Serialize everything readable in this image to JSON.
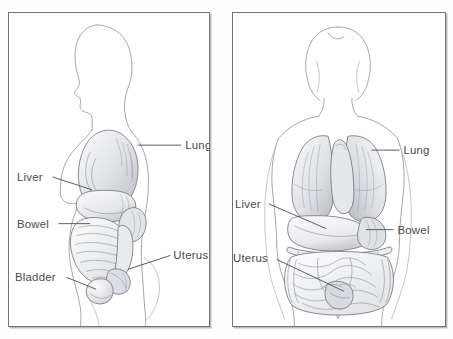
{
  "figure": {
    "background_color": "#ffffff",
    "panel_border_color": "#6f7276",
    "label_color": "#4a4a4c",
    "organ_stroke_color": "#74767b",
    "body_outline_color": "#9a9ca1"
  },
  "panels": [
    {
      "id": "side-view",
      "name": "side-view-panel",
      "labels": [
        {
          "text": "Lung",
          "side": "right",
          "x": 178,
          "y": 133
        },
        {
          "text": "Liver",
          "side": "left",
          "x": 14,
          "y": 165
        },
        {
          "text": "Bowel",
          "side": "left",
          "x": 10,
          "y": 200
        },
        {
          "text": "Bladder",
          "side": "left",
          "x": 8,
          "y": 254
        },
        {
          "text": "Uterus",
          "side": "right",
          "x": 167,
          "y": 243
        }
      ]
    },
    {
      "id": "front-view",
      "name": "front-view-panel",
      "labels": [
        {
          "text": "Lung",
          "side": "right",
          "x": 172,
          "y": 138
        },
        {
          "text": "Liver",
          "side": "left",
          "x": 4,
          "y": 191
        },
        {
          "text": "Bowel",
          "side": "right",
          "x": 166,
          "y": 218
        },
        {
          "text": "Uterus",
          "side": "left",
          "x": 2,
          "y": 247
        }
      ]
    }
  ]
}
